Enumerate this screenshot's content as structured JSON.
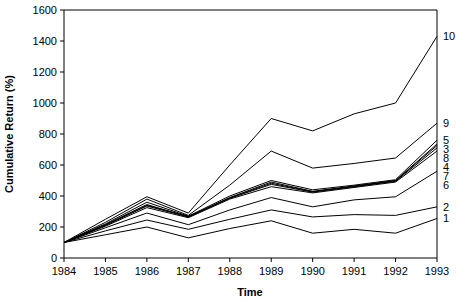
{
  "chart_data": {
    "type": "line",
    "title": "",
    "xlabel": "Time",
    "ylabel": "Cumulative Return (%)",
    "x": [
      1984,
      1985,
      1986,
      1987,
      1988,
      1989,
      1990,
      1991,
      1992,
      1993
    ],
    "xtick_labels": [
      "1984",
      "1985",
      "1986",
      "1987",
      "1988",
      "1989",
      "1990",
      "1991",
      "1992",
      "1993"
    ],
    "ytick_labels": [
      "0",
      "200",
      "400",
      "600",
      "800",
      "1000",
      "1200",
      "1400",
      "1600"
    ],
    "yticks": [
      0,
      200,
      400,
      600,
      800,
      1000,
      1200,
      1400,
      1600
    ],
    "ylim": [
      0,
      1600
    ],
    "xlim": [
      1984,
      1993
    ],
    "grid": false,
    "legend_position": "right-edge-inline",
    "series": [
      {
        "name": "1",
        "label": "1",
        "values": [
          100,
          150,
          200,
          130,
          190,
          240,
          160,
          185,
          160,
          255
        ]
      },
      {
        "name": "2",
        "label": "2",
        "values": [
          100,
          175,
          245,
          185,
          250,
          310,
          265,
          280,
          275,
          330
        ]
      },
      {
        "name": "3",
        "label": "3",
        "values": [
          100,
          215,
          345,
          265,
          390,
          490,
          430,
          465,
          500,
          735
        ]
      },
      {
        "name": "4",
        "label": "4",
        "values": [
          100,
          210,
          335,
          265,
          385,
          475,
          425,
          460,
          495,
          710
        ]
      },
      {
        "name": "5",
        "label": "5",
        "values": [
          100,
          220,
          360,
          270,
          400,
          500,
          440,
          470,
          505,
          760
        ]
      },
      {
        "name": "6",
        "label": "6",
        "values": [
          100,
          195,
          290,
          215,
          310,
          390,
          330,
          375,
          395,
          560
        ]
      },
      {
        "name": "7",
        "label": "7",
        "values": [
          100,
          205,
          325,
          260,
          380,
          460,
          420,
          455,
          490,
          690
        ]
      },
      {
        "name": "8",
        "label": "8",
        "values": [
          100,
          212,
          340,
          268,
          388,
          482,
          428,
          462,
          498,
          725
        ]
      },
      {
        "name": "9",
        "label": "9",
        "values": [
          100,
          230,
          380,
          275,
          470,
          690,
          580,
          610,
          645,
          870
        ]
      },
      {
        "name": "10",
        "label": "10",
        "values": [
          100,
          250,
          395,
          290,
          600,
          900,
          820,
          930,
          1000,
          1430
        ]
      }
    ]
  }
}
